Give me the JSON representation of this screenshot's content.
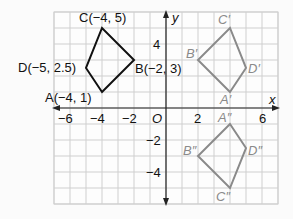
{
  "axes": {
    "x_label": "x",
    "y_label": "y",
    "origin_label": "O",
    "x_ticks": [
      {
        "value": -6,
        "label": "−6"
      },
      {
        "value": -4,
        "label": "−4"
      },
      {
        "value": -2,
        "label": "−2"
      },
      {
        "value": 2,
        "label": "2"
      },
      {
        "value": 6,
        "label": "6"
      }
    ],
    "y_ticks": [
      {
        "value": 4,
        "label": "4"
      },
      {
        "value": -2,
        "label": "−2"
      },
      {
        "value": -4,
        "label": "−4"
      }
    ],
    "x_range": [
      -7,
      7
    ],
    "y_range": [
      -6,
      6
    ]
  },
  "figures": {
    "ABCD": {
      "color": "#111111",
      "vertices": [
        {
          "name": "A",
          "x": -4,
          "y": 1,
          "label": "A(−4, 1)"
        },
        {
          "name": "B",
          "x": -2,
          "y": 3,
          "label": "B(−2, 3)"
        },
        {
          "name": "C",
          "x": -4,
          "y": 5,
          "label": "C(−4, 5)"
        },
        {
          "name": "D",
          "x": -5,
          "y": 2.5,
          "label": "D(−5, 2.5)"
        }
      ]
    },
    "A1B1C1D1": {
      "color": "#8a8a8a",
      "vertices": [
        {
          "name": "A'",
          "x": 4,
          "y": 1,
          "label": "A′"
        },
        {
          "name": "B'",
          "x": 2,
          "y": 3,
          "label": "B′"
        },
        {
          "name": "C'",
          "x": 4,
          "y": 5,
          "label": "C′"
        },
        {
          "name": "D'",
          "x": 5,
          "y": 2.5,
          "label": "D′"
        }
      ]
    },
    "A2B2C2D2": {
      "color": "#8a8a8a",
      "vertices": [
        {
          "name": "A''",
          "x": 4,
          "y": -1,
          "label": "A″"
        },
        {
          "name": "B''",
          "x": 2,
          "y": -3,
          "label": "B″"
        },
        {
          "name": "C''",
          "x": 4,
          "y": -5,
          "label": "C″"
        },
        {
          "name": "D''",
          "x": 5,
          "y": -2.5,
          "label": "D″"
        }
      ]
    }
  }
}
